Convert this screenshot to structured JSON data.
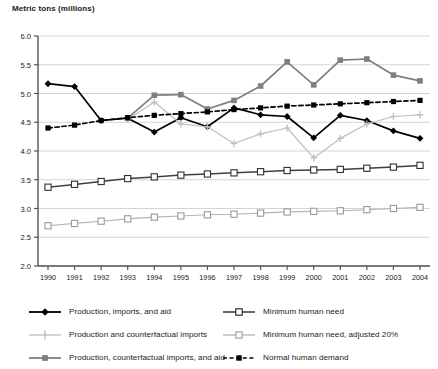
{
  "chart_data": {
    "type": "line",
    "title": "Metric tons (millions)",
    "ylabel": "Metric tons (millions)",
    "xlabel": "",
    "ylim": [
      2.0,
      6.0
    ],
    "ytick_step": 0.5,
    "yticks": [
      "2.0",
      "2.5",
      "3.0",
      "3.5",
      "4.0",
      "4.5",
      "5.0",
      "5.5",
      "6.0"
    ],
    "grid": true,
    "legend_position": "bottom",
    "categories": [
      "1990",
      "1991",
      "1992",
      "1993",
      "1994",
      "1995",
      "1996",
      "1997",
      "1998",
      "1999",
      "2000",
      "2001",
      "2002",
      "2003",
      "2004"
    ],
    "series": [
      {
        "name": "Production, imports, and aid",
        "color": "#000000",
        "marker": "diamond",
        "dash": "solid",
        "values": [
          5.17,
          5.12,
          4.53,
          4.57,
          4.33,
          4.58,
          4.42,
          4.75,
          4.63,
          4.6,
          4.23,
          4.62,
          4.53,
          4.35,
          4.22
        ]
      },
      {
        "name": "Production and counterfactual imports",
        "color": "#bfbfbf",
        "marker": "plus",
        "dash": "solid",
        "values": [
          null,
          null,
          null,
          4.55,
          4.85,
          4.47,
          4.42,
          4.13,
          4.3,
          4.4,
          3.88,
          4.22,
          4.47,
          4.6,
          4.63
        ]
      },
      {
        "name": "Production, counterfactual imports, and aid",
        "color": "#7f7f7f",
        "marker": "square",
        "dash": "solid",
        "values": [
          null,
          null,
          null,
          4.57,
          4.97,
          4.98,
          4.73,
          4.88,
          5.13,
          5.55,
          5.15,
          5.58,
          5.6,
          5.32,
          5.22
        ]
      },
      {
        "name": "Minimum human need",
        "color": "#404040",
        "marker": "open-square",
        "dash": "solid",
        "values": [
          3.37,
          3.42,
          3.47,
          3.52,
          3.55,
          3.58,
          3.6,
          3.62,
          3.64,
          3.66,
          3.67,
          3.68,
          3.7,
          3.72,
          3.75
        ]
      },
      {
        "name": "Minimum human need, adjusted 20%",
        "color": "#9a9a9a",
        "marker": "open-square",
        "dash": "solid",
        "values": [
          2.7,
          2.74,
          2.78,
          2.82,
          2.85,
          2.87,
          2.89,
          2.9,
          2.92,
          2.94,
          2.95,
          2.96,
          2.98,
          3.0,
          3.02
        ]
      },
      {
        "name": "Normal human demand",
        "color": "#000000",
        "marker": "square-filled",
        "dash": "dashed",
        "values": [
          4.4,
          4.45,
          4.53,
          4.58,
          4.62,
          4.65,
          4.68,
          4.72,
          4.75,
          4.78,
          4.8,
          4.82,
          4.84,
          4.86,
          4.88
        ]
      }
    ]
  },
  "legend": {
    "left": [
      {
        "label": "Production, imports, and aid"
      },
      {
        "label": "Production and counterfactual imports"
      },
      {
        "label": "Production, counterfactual imports, and aid"
      }
    ],
    "right": [
      {
        "label": "Minimum human need"
      },
      {
        "label": "Minimum human need, adjusted 20%"
      },
      {
        "label": "Normal human demand"
      }
    ]
  }
}
